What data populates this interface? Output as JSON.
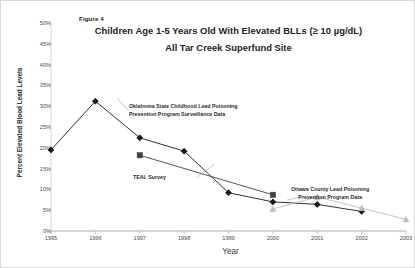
{
  "figure": {
    "label": "Figure 4",
    "title_line1": "Children Age 1-5 Years Old With Elevated BLLs (≥ 10 µg/dL)",
    "title_line2": "All Tar Creek Superfund Site"
  },
  "annotations": {
    "oklahoma_line1": "Oklahoma State Childhood Lead Poisoning",
    "oklahoma_line2": "Prevention Program Surveillance Data",
    "teal": "TEAL Survey",
    "ottawa_line1": "Ottawa County Lead Poisoning",
    "ottawa_line2": "Prevention Program Data"
  },
  "chart_data": {
    "type": "line",
    "title": "Children Age 1-5 Years Old With Elevated BLLs (≥ 10 µg/dL) All Tar Creek Superfund Site",
    "xlabel": "Year",
    "ylabel": "Percent Elevated Blood Lead Levels",
    "x": [
      1995,
      1996,
      1997,
      1998,
      1999,
      2000,
      2001,
      2002,
      2003
    ],
    "xtick_labels": [
      "1995",
      "1996",
      "1997",
      "1998",
      "1999",
      "2000",
      "2001",
      "2002",
      "2003"
    ],
    "ytick_labels": [
      "0%",
      "5%",
      "10%",
      "15%",
      "20%",
      "25%",
      "30%",
      "35%",
      "40%",
      "45%",
      "50%"
    ],
    "ytick_values": [
      0,
      5,
      10,
      15,
      20,
      25,
      30,
      35,
      40,
      45,
      50
    ],
    "ylim": [
      0,
      50
    ],
    "xlim": [
      1995,
      2003
    ],
    "grid": false,
    "legend_position": "inline-annotations",
    "series": [
      {
        "name": "Oklahoma State Childhood Lead Poisoning Prevention Program Surveillance Data",
        "marker": "diamond",
        "color": "#1a1a1a",
        "x": [
          1995,
          1996,
          1997,
          1998,
          1999,
          2000,
          2001,
          2002
        ],
        "values": [
          19.5,
          31.2,
          22.4,
          19.2,
          9.2,
          7.0,
          6.4,
          4.7
        ]
      },
      {
        "name": "TEAL Survey",
        "marker": "square",
        "color": "#404040",
        "x": [
          1997,
          2000
        ],
        "values": [
          18.2,
          8.7
        ]
      },
      {
        "name": "Ottawa County Lead Poisoning Prevention Program Data",
        "marker": "triangle",
        "color": "#bdbdbd",
        "x": [
          2000,
          2001,
          2002,
          2003
        ],
        "values": [
          5.3,
          8.2,
          5.5,
          2.8
        ]
      }
    ]
  }
}
